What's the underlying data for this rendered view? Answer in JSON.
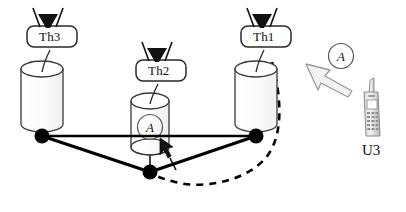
{
  "figure": {
    "kind": "network-topology-diagram",
    "background_color": "#ffffff",
    "line_color": "#000000",
    "cylinder_stroke": "#333333",
    "arrow_fill": "#f2f2f2",
    "arrow_stroke": "#9a9a9a",
    "phone_color": "#8a8a8a"
  },
  "base_stations": [
    {
      "id": "th3",
      "label": "Th3",
      "x": 56,
      "y": 108,
      "antenna": "antenna-icon"
    },
    {
      "id": "th2",
      "label": "Th2",
      "x": 170,
      "y": 128,
      "antenna": "antenna-icon"
    },
    {
      "id": "th1",
      "label": "Th1",
      "x": 255,
      "y": 108,
      "antenna": "antenna-icon"
    }
  ],
  "nodes": [
    {
      "id": "node-left",
      "x": 42,
      "y": 136
    },
    {
      "id": "node-right",
      "x": 256,
      "y": 136
    },
    {
      "id": "node-bottom",
      "x": 150,
      "y": 172
    }
  ],
  "edges": [
    {
      "from": "node-left",
      "to": "node-right"
    },
    {
      "from": "node-left",
      "to": "node-bottom"
    },
    {
      "from": "node-bottom",
      "to": "node-right"
    }
  ],
  "dashed_path": {
    "name": "handover-path",
    "style": "dashed",
    "from": "th1-cylinder-right",
    "to": "node-bottom"
  },
  "annotations": {
    "agent_in_cylinder": {
      "text": "A",
      "host": "th2",
      "name": "agent-marker-a"
    },
    "agent_pointer": {
      "text": "A",
      "name": "agent-arrow-a"
    },
    "cursor_arrow": {
      "name": "cursor-arrow-icon"
    }
  },
  "user_terminal": {
    "id": "u3",
    "label": "U3",
    "device": "mobile-phone-icon"
  }
}
